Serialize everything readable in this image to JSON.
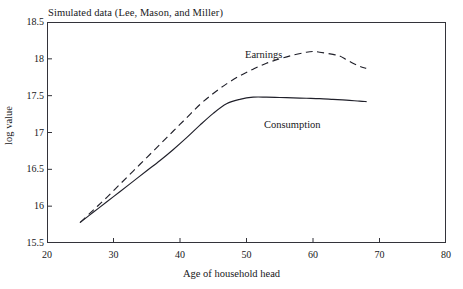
{
  "chart_data": {
    "type": "line",
    "title": "Simulated data (Lee, Mason, and Miller)",
    "xlabel": "Age of household head",
    "ylabel": "log value",
    "xlim": [
      20,
      80
    ],
    "ylim": [
      15.5,
      18.5
    ],
    "xticks": [
      20,
      30,
      40,
      50,
      60,
      70,
      80
    ],
    "xtick_labels": [
      "20",
      "30",
      "40",
      "50",
      "60",
      "70",
      "80"
    ],
    "yticks": [
      15.5,
      16,
      16.5,
      17,
      17.5,
      18,
      18.5
    ],
    "ytick_labels": [
      "15.5",
      "16",
      "16.5",
      "17",
      "17.5",
      "18",
      "18.5"
    ],
    "grid": false,
    "legend_position": "inline-annotation",
    "series": [
      {
        "name": "Earnings",
        "style": "dashed",
        "color": "#20202a",
        "x": [
          25,
          27,
          29,
          31,
          33,
          35,
          37,
          39,
          41,
          43,
          45,
          47,
          49,
          51,
          53,
          55,
          57,
          59,
          60,
          61,
          63,
          64,
          65,
          66,
          67,
          68
        ],
        "values": [
          15.78,
          15.95,
          16.12,
          16.3,
          16.48,
          16.66,
          16.84,
          17.02,
          17.2,
          17.38,
          17.53,
          17.66,
          17.77,
          17.86,
          17.94,
          18.0,
          18.05,
          18.09,
          18.1,
          18.09,
          18.06,
          18.04,
          17.99,
          17.94,
          17.9,
          17.87
        ]
      },
      {
        "name": "Consumption",
        "style": "solid",
        "color": "#20202a",
        "x": [
          25,
          27,
          29,
          31,
          33,
          35,
          37,
          39,
          41,
          43,
          45,
          47,
          49,
          51,
          53,
          55,
          57,
          59,
          61,
          63,
          65,
          67,
          68
        ],
        "values": [
          15.78,
          15.92,
          16.06,
          16.2,
          16.34,
          16.48,
          16.62,
          16.77,
          16.93,
          17.1,
          17.26,
          17.39,
          17.45,
          17.48,
          17.48,
          17.475,
          17.47,
          17.465,
          17.46,
          17.45,
          17.44,
          17.425,
          17.42
        ]
      }
    ],
    "annotations": [
      {
        "text": "Earnings",
        "series": "Earnings"
      },
      {
        "text": "Consumption",
        "series": "Consumption"
      }
    ]
  },
  "chart": {
    "title": "Simulated data (Lee, Mason, and Miller)",
    "x_axis_title": "Age of household head",
    "y_axis_title": "log value",
    "label_earnings": "Earnings",
    "label_consumption": "Consumption"
  }
}
